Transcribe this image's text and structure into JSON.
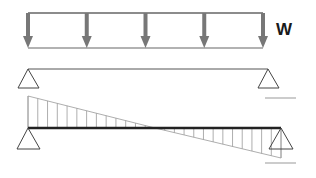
{
  "diagram": {
    "load_label": "W",
    "load_arrow_count": 5,
    "colors": {
      "load_arrow": "#777777",
      "load_box": "#666666",
      "beam": "#444444",
      "beam_thick": "#222222",
      "support": "#333333",
      "hatch": "#999999",
      "guide_line": "#aaaaaa"
    },
    "shear_diagram": {
      "left_value_sign": "positive",
      "right_value_sign": "negative",
      "zero_crossing": "midspan",
      "hatch_segments_left": 13,
      "hatch_segments_right": 13
    },
    "supports": [
      {
        "name": "left-pin",
        "type": "pin"
      },
      {
        "name": "right-pin",
        "type": "pin"
      }
    ]
  }
}
